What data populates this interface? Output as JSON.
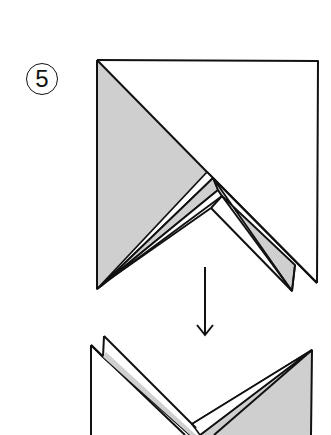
{
  "diagram": {
    "type": "origami-instruction",
    "step_number": "5",
    "colors": {
      "paper_colored_side": "#cfcfcf",
      "paper_white_side": "#ffffff",
      "line": "#111111"
    },
    "figures": [
      {
        "name": "before-fold",
        "description": "Square with left triangle shaded, layered V folds at bottom"
      },
      {
        "name": "after-fold",
        "description": "Result: M-shaped layered form with right triangle shaded"
      }
    ],
    "arrow": {
      "direction": "down",
      "meaning": "next state"
    }
  }
}
